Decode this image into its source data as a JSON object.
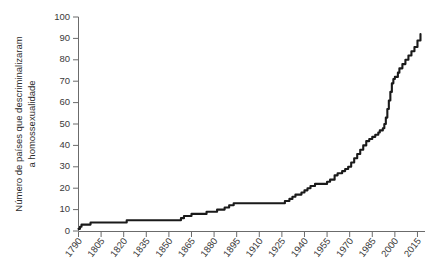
{
  "chart_data": {
    "type": "line",
    "title": "",
    "subtitle": "",
    "xlabel": "",
    "ylabel": "Número de países que descriminalizaram a homossexualidade",
    "ylabel_line1": "Número de países que descriminalizaram",
    "ylabel_line2": "a homossexualidade",
    "xlim": [
      1790,
      2020
    ],
    "ylim": [
      0,
      100
    ],
    "xticks": [
      1790,
      1805,
      1820,
      1835,
      1850,
      1865,
      1880,
      1895,
      1910,
      1925,
      1940,
      1955,
      1970,
      1985,
      2000,
      2015
    ],
    "xtick_labels": [
      "1790",
      "1805",
      "1820",
      "1835",
      "1850",
      "1865",
      "1880",
      "1895",
      "1910",
      "1925",
      "1940",
      "1955",
      "1970",
      "1985",
      "2000",
      "2015"
    ],
    "yticks": [
      0,
      10,
      20,
      30,
      40,
      50,
      60,
      70,
      80,
      90,
      100
    ],
    "ytick_labels": [
      "0",
      "10",
      "20",
      "30",
      "40",
      "50",
      "60",
      "70",
      "80",
      "90",
      "100"
    ],
    "grid": false,
    "legend": false,
    "legend_position": "none",
    "line_color": "#1a1a1a",
    "axis_color": "#6b6b6b",
    "series": [
      {
        "name": "Países que descriminalizaram a homossexualidade",
        "x": [
          1790,
          1791,
          1792,
          1795,
          1798,
          1800,
          1805,
          1810,
          1811,
          1813,
          1815,
          1820,
          1822,
          1825,
          1830,
          1832,
          1835,
          1837,
          1840,
          1845,
          1850,
          1852,
          1855,
          1857,
          1858,
          1860,
          1862,
          1864,
          1865,
          1867,
          1870,
          1872,
          1875,
          1877,
          1880,
          1882,
          1885,
          1887,
          1889,
          1890,
          1893,
          1895,
          1900,
          1905,
          1910,
          1915,
          1920,
          1922,
          1925,
          1927,
          1930,
          1932,
          1934,
          1936,
          1938,
          1940,
          1942,
          1944,
          1945,
          1947,
          1950,
          1952,
          1955,
          1957,
          1960,
          1962,
          1965,
          1967,
          1969,
          1971,
          1973,
          1975,
          1977,
          1979,
          1981,
          1983,
          1985,
          1987,
          1989,
          1990,
          1992,
          1993,
          1994,
          1995,
          1996,
          1997,
          1998,
          1999,
          2000,
          2002,
          2003,
          2005,
          2007,
          2009,
          2011,
          2013,
          2015,
          2017
        ],
        "values": [
          1,
          2,
          3,
          3,
          4,
          4,
          4,
          4,
          4,
          4,
          4,
          4,
          5,
          5,
          5,
          5,
          5,
          5,
          5,
          5,
          5,
          5,
          5,
          5,
          6,
          7,
          7,
          7,
          8,
          8,
          8,
          8,
          9,
          9,
          9,
          10,
          10,
          11,
          11,
          12,
          13,
          13,
          13,
          13,
          13,
          13,
          13,
          13,
          13,
          14,
          15,
          16,
          17,
          17,
          18,
          19,
          20,
          21,
          21,
          22,
          22,
          22,
          23,
          24,
          26,
          27,
          28,
          29,
          30,
          32,
          34,
          36,
          38,
          40,
          42,
          43,
          44,
          45,
          46,
          47,
          48,
          50,
          53,
          57,
          61,
          65,
          69,
          71,
          72,
          74,
          76,
          78,
          80,
          82,
          84,
          86,
          89,
          92
        ]
      }
    ],
    "start_value": 1,
    "end_value": 92,
    "notable_points": [
      {
        "year": 1791,
        "value": 2
      },
      {
        "year": 1800,
        "value": 4
      },
      {
        "year": 1860,
        "value": 7
      },
      {
        "year": 1893,
        "value": 13
      },
      {
        "year": 1925,
        "value": 13
      },
      {
        "year": 1940,
        "value": 19
      },
      {
        "year": 1955,
        "value": 23
      },
      {
        "year": 1970,
        "value": 31
      },
      {
        "year": 1985,
        "value": 44
      },
      {
        "year": 1995,
        "value": 57
      },
      {
        "year": 2000,
        "value": 72
      },
      {
        "year": 2015,
        "value": 89
      }
    ]
  },
  "figure": {
    "caption": "",
    "background_color": "#ffffff"
  }
}
